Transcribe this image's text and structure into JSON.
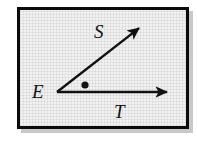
{
  "figure": {
    "kind": "geometry-angle-diagram",
    "frame": {
      "border_color": "#0b0b0b",
      "fill_color": "#f2f2f2",
      "shadow_color": "#c9c9c9",
      "border_width_px": 3,
      "x": 17,
      "y": 7,
      "width": 166,
      "height": 116
    },
    "vertex": {
      "name": "E",
      "label": "E",
      "x": 57,
      "y": 92
    },
    "rays": [
      {
        "name": "ray-S",
        "label": "S",
        "from_x": 57,
        "from_y": 92,
        "to_x": 143,
        "to_y": 25,
        "arrowhead": true,
        "label_x": 94,
        "label_y": 22
      },
      {
        "name": "ray-T",
        "label": "T",
        "from_x": 57,
        "from_y": 92,
        "to_x": 172,
        "to_y": 92,
        "arrowhead": true,
        "label_x": 114,
        "label_y": 102
      }
    ],
    "interior_point": {
      "name": "interior-dot",
      "x": 85,
      "y": 85,
      "radius": 3.6,
      "color": "#111111"
    },
    "stroke_color": "#111111",
    "stroke_width_px": 2.4
  }
}
